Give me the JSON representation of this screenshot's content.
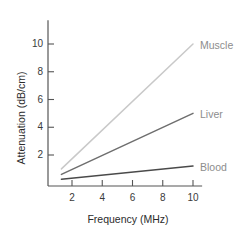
{
  "chart_data": {
    "type": "line",
    "title": "",
    "xlabel": "Frequency (MHz)",
    "ylabel": "Attenuation (dB/cm)",
    "xlim": [
      0,
      11
    ],
    "ylim": [
      0,
      11
    ],
    "xticks": [
      2,
      4,
      6,
      8,
      10
    ],
    "yticks": [
      2,
      4,
      6,
      8,
      10
    ],
    "grid": false,
    "legend_position": "inline-right-of-line-end",
    "series": [
      {
        "name": "Muscle",
        "color": "#c9c9c9",
        "x": [
          1.3,
          10
        ],
        "values": [
          1.0,
          10.0
        ]
      },
      {
        "name": "Liver",
        "color": "#6e6e6e",
        "x": [
          1.3,
          10
        ],
        "values": [
          0.6,
          5.0
        ]
      },
      {
        "name": "Blood",
        "color": "#4a4a4a",
        "x": [
          1.3,
          10
        ],
        "values": [
          0.25,
          1.2
        ]
      }
    ]
  },
  "axis_style": {
    "axis_color": "#555555",
    "label_color": "#3a3a3a",
    "series_label_color": "#8d8d8d"
  }
}
